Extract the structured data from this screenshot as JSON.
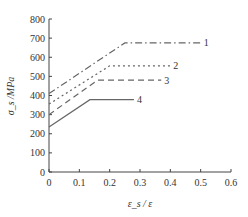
{
  "chart_data": {
    "type": "line",
    "title": "",
    "xlabel": "ε_s / ε",
    "ylabel": "σ_s /MPa",
    "xlim": [
      0,
      0.6
    ],
    "ylim": [
      0,
      800
    ],
    "x_ticks": [
      "0",
      "0.1",
      "0.2",
      "0.3",
      "0.4",
      "0.5",
      "0.6"
    ],
    "y_ticks": [
      "0",
      "100",
      "200",
      "300",
      "400",
      "500",
      "600",
      "700",
      "800"
    ],
    "grid": false,
    "legend": "inline labels at line ends (right)",
    "series": [
      {
        "name": "1",
        "style": "dash-dot",
        "points": [
          [
            0,
            410
          ],
          [
            0.25,
            675
          ],
          [
            0.5,
            675
          ]
        ]
      },
      {
        "name": "2",
        "style": "dotted",
        "points": [
          [
            0,
            355
          ],
          [
            0.2,
            555
          ],
          [
            0.4,
            555
          ]
        ]
      },
      {
        "name": "3",
        "style": "dashed",
        "points": [
          [
            0,
            300
          ],
          [
            0.16,
            480
          ],
          [
            0.37,
            480
          ]
        ]
      },
      {
        "name": "4",
        "style": "solid",
        "points": [
          [
            0,
            235
          ],
          [
            0.135,
            378
          ],
          [
            0.28,
            378
          ]
        ]
      }
    ]
  }
}
